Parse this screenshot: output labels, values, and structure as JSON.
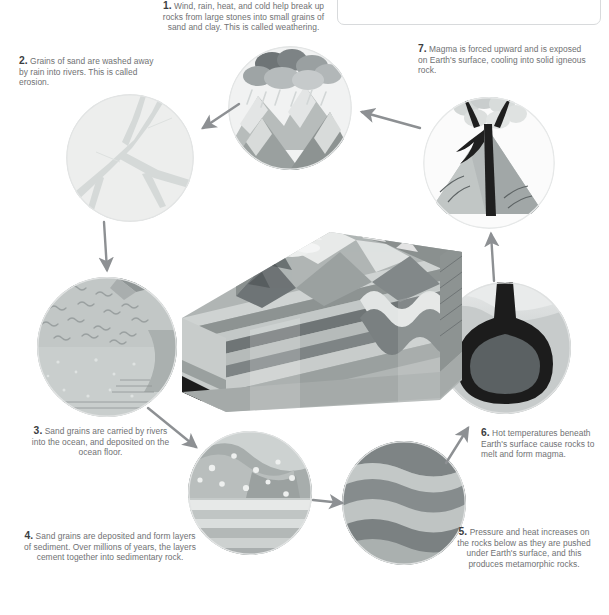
{
  "diagram": {
    "note_box": {
      "text": ""
    },
    "steps": [
      {
        "number": "1.",
        "text": "Wind, rain, heat, and cold help break up rocks from large stones into small grains of sand and clay. This is called weathering.",
        "icon": "mountains-rain-icon",
        "stage_label": "weathering"
      },
      {
        "number": "2.",
        "text": "Grains of sand are washed away by rain into rivers. This is called erosion.",
        "icon": "river-network-icon",
        "stage_label": "erosion"
      },
      {
        "number": "3.",
        "text": "Sand grains are carried by rivers into the ocean, and deposited on the ocean floor.",
        "icon": "ocean-floor-icon",
        "stage_label": "deposition"
      },
      {
        "number": "4.",
        "text": "Sand grains are deposited and form layers of sediment. Over millions of years, the layers cement together into sedimentary rock.",
        "icon": "sediment-layers-icon",
        "stage_label": "sedimentary rock"
      },
      {
        "number": "5.",
        "text": "Pressure and heat increases on the rocks below as they are pushed under Earth's surface, and this produces metamorphic rocks.",
        "icon": "folded-bands-icon",
        "stage_label": "metamorphic rock"
      },
      {
        "number": "6.",
        "text": "Hot temperatures beneath Earth's surface cause rocks to melt and form magma.",
        "icon": "magma-chamber-icon",
        "stage_label": "magma"
      },
      {
        "number": "7.",
        "text": "Magma is forced upward and is exposed on Earth's surface, cooling into solid igneous rock.",
        "icon": "erupting-volcano-icon",
        "stage_label": "igneous rock"
      }
    ],
    "center_illustration": {
      "name": "geological-block-diagram",
      "description": "3D cutaway block of folded rock strata with eroded mountain top"
    },
    "colors": {
      "text_body": "#6f7173",
      "text_number": "#3b3d3f",
      "arrow": "#8d9093",
      "circle_pale": "#eceeed",
      "circle_light": "#d7dbda",
      "circle_mid": "#b9bebd",
      "circle_dark": "#8f9596",
      "circle_darker": "#6e7476",
      "magma_black": "#1c1c1c",
      "page_bg": "#ffffff"
    }
  }
}
